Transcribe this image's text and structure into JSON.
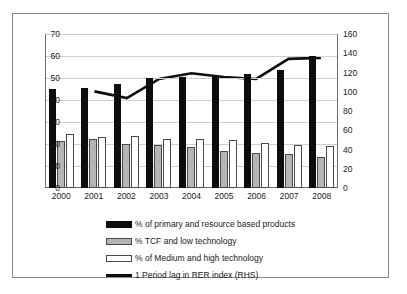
{
  "chart_data": {
    "type": "bar",
    "title": "",
    "subtitle": "",
    "xlabel": "",
    "ylabel": "",
    "y2label": "",
    "grid": true,
    "legend_position": "bottom",
    "categories": [
      "2000",
      "2001",
      "2002",
      "2003",
      "2004",
      "2005",
      "2006",
      "2007",
      "2008"
    ],
    "ylim": [
      0,
      70
    ],
    "yticks": [
      "0",
      "10",
      "20",
      "30",
      "40",
      "50",
      "60",
      "70"
    ],
    "y2lim": [
      0,
      160
    ],
    "y2ticks": [
      "0",
      "20",
      "40",
      "60",
      "80",
      "100",
      "120",
      "140",
      "160"
    ],
    "series": [
      {
        "name": "% of primary and resource based products",
        "type": "bar",
        "axis": "left",
        "color": "#0d0d0d",
        "values": [
          45,
          45.5,
          47.5,
          50,
          50.5,
          51.5,
          52,
          53.5,
          60
        ]
      },
      {
        "name": "% TCF and low technology",
        "type": "bar",
        "axis": "left",
        "color": "#b5b5b5",
        "values": [
          21.5,
          22.5,
          20,
          19.5,
          18.5,
          17,
          16,
          15.5,
          14
        ]
      },
      {
        "name": "% of Medium and high technology",
        "type": "bar",
        "axis": "left",
        "color": "#ffffff",
        "values": [
          24.5,
          23,
          23.5,
          22.5,
          22.5,
          22,
          20.5,
          19.5,
          19
        ]
      },
      {
        "name": "1 Period lag in RER index (RHS)",
        "type": "line",
        "axis": "right",
        "color": "#0d0d0d",
        "values": [
          null,
          100,
          93,
          113,
          119,
          115,
          113,
          134,
          135
        ]
      }
    ]
  },
  "legend": {
    "items": [
      {
        "label": "% of primary and resource based products",
        "swatch": "primary"
      },
      {
        "label": "% TCF and low technology",
        "swatch": "tcf"
      },
      {
        "label": "% of Medium and high technology",
        "swatch": "medhigh"
      },
      {
        "label": "1 Period lag in RER index (RHS)",
        "swatch": "line"
      }
    ]
  }
}
